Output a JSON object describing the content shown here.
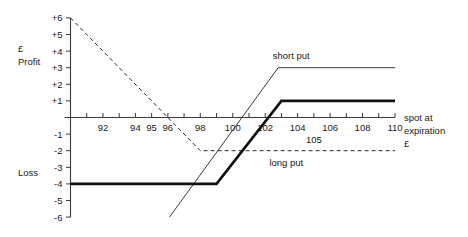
{
  "chart_data": {
    "type": "line",
    "title": "",
    "xlabel": "spot at expiration £",
    "ylabel_top": "£ Profit",
    "ylabel_bottom": "Loss",
    "xlim": [
      90,
      110
    ],
    "ylim": [
      -6,
      6
    ],
    "grid": false,
    "x_ticks": [
      90,
      91,
      92,
      93,
      94,
      95,
      96,
      97,
      98,
      99,
      100,
      101,
      102,
      103,
      104,
      105,
      106,
      107,
      108,
      109,
      110
    ],
    "x_tick_labels_shown": [
      "92",
      "94",
      "95",
      "96",
      "98",
      "100",
      "102",
      "104",
      "105",
      "106",
      "108",
      "110"
    ],
    "y_ticks": [
      6,
      5,
      4,
      3,
      2,
      1,
      -1,
      -2,
      -3,
      -4,
      -5,
      -6
    ],
    "y_tick_labels": [
      "+6",
      "+5",
      "+4",
      "+3",
      "+2",
      "+1",
      "-1",
      "-2",
      "-3",
      "-4",
      "-5",
      "-6"
    ],
    "series": [
      {
        "name": "long put",
        "style": "dashed",
        "width": "thin",
        "points": [
          [
            90,
            6
          ],
          [
            96,
            0
          ],
          [
            98,
            -2
          ],
          [
            110,
            -2
          ]
        ],
        "label_text": "long put",
        "label_x": 103.3,
        "label_y": -2.95
      },
      {
        "name": "short put",
        "style": "solid",
        "width": "thin",
        "points": [
          [
            96.1,
            -6
          ],
          [
            102.8,
            3
          ],
          [
            110,
            3
          ]
        ],
        "label_text": "short put",
        "label_x": 103.6,
        "label_y": 3.55
      },
      {
        "name": "covered position",
        "style": "solid",
        "width": "thick",
        "points": [
          [
            90,
            -4
          ],
          [
            99,
            -4
          ],
          [
            103,
            1
          ],
          [
            110,
            1
          ]
        ],
        "label_text": "",
        "label_x": 0,
        "label_y": 0
      }
    ],
    "axis_label_lines": [
      "spot at",
      "expiration",
      "£"
    ]
  }
}
